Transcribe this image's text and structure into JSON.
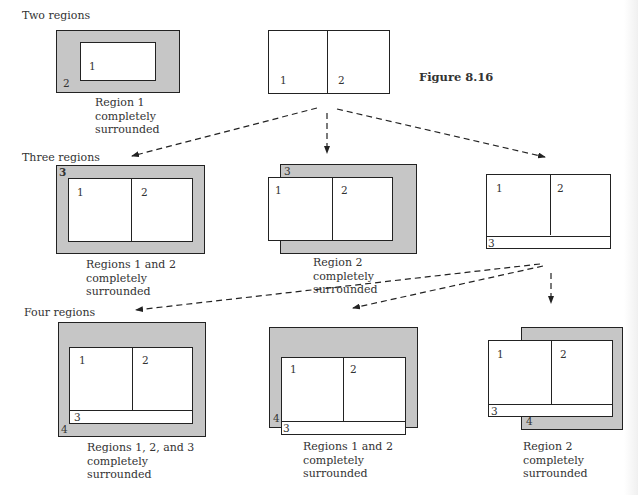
{
  "figure": {
    "title": "Figure 8.16",
    "sections": [
      {
        "heading": "Two regions"
      },
      {
        "heading": "Three regions"
      },
      {
        "heading": "Four regions"
      }
    ],
    "row1": {
      "left": {
        "labels": [
          "1",
          "2"
        ],
        "caption": "Region 1\ncompletely\nsurrounded"
      },
      "right": {
        "labels": [
          "1",
          "2"
        ]
      }
    },
    "row2": {
      "left": {
        "labels": [
          "1",
          "2",
          "3"
        ],
        "caption": "Regions 1 and 2\ncompletely\nsurrounded"
      },
      "middle": {
        "labels": [
          "1",
          "2",
          "3"
        ],
        "caption": "Region 2\ncompletely\nsurrounded"
      },
      "right": {
        "labels": [
          "1",
          "2",
          "3"
        ]
      }
    },
    "row3": {
      "left": {
        "labels": [
          "1",
          "2",
          "3",
          "4"
        ],
        "caption": "Regions 1, 2, and 3\ncompletely\nsurrounded"
      },
      "middle": {
        "labels": [
          "1",
          "2",
          "3",
          "4"
        ],
        "caption": "Regions 1 and 2\ncompletely\nsurrounded"
      },
      "right": {
        "labels": [
          "1",
          "2",
          "3",
          "4"
        ],
        "caption": "Region 2\ncompletely\nsurrounded"
      }
    },
    "colors": {
      "fill_gray": "#c6c6c6",
      "line": "#222222",
      "background": "#ffffff"
    }
  }
}
